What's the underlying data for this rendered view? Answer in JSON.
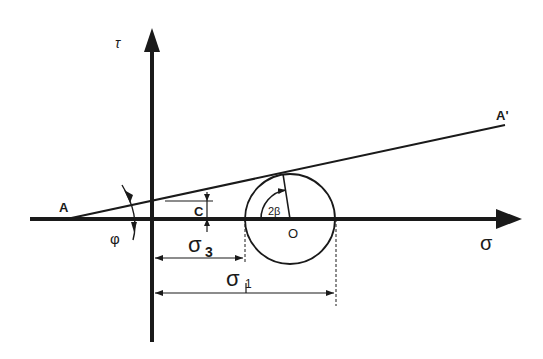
{
  "diagram": {
    "type": "mohr-coulomb-failure-envelope",
    "axes": {
      "x_label": "σ",
      "y_label": "τ"
    },
    "points": {
      "A": "A",
      "A_prime": "A'",
      "O": "O",
      "C": "C"
    },
    "angles": {
      "phi": "φ",
      "two_beta": "2β"
    },
    "dimensions": {
      "sigma3_base": "σ",
      "sigma3_sub": "3",
      "sigma1_base": "σ",
      "sigma1_sub": "1"
    },
    "colors": {
      "ink": "#1a1a1a",
      "background": "#ffffff"
    }
  }
}
